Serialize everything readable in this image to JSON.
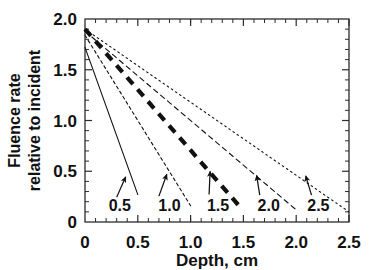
{
  "chart_data": {
    "type": "line",
    "title": "",
    "xlabel": "Depth, cm",
    "ylabel_line1": "Fluence rate",
    "ylabel_line2": "relative to incident",
    "xlim": [
      0,
      2.5
    ],
    "ylim": [
      0,
      2.0
    ],
    "xticks": [
      0,
      0.5,
      1.0,
      1.5,
      2.0,
      2.5
    ],
    "xticklabels": [
      "0",
      "0.5",
      "1.0",
      "1.5",
      "2.0",
      "2.5"
    ],
    "yticks": [
      0,
      0.5,
      1.0,
      1.5,
      2.0
    ],
    "yticklabels": [
      "0",
      "0.5",
      "1.0",
      "1.5",
      "2.0"
    ],
    "minor_ticks": true,
    "grid": false,
    "legend_position": "inline-callouts",
    "frame": "box",
    "series": [
      {
        "name": "0.5",
        "style": "solid",
        "width": 1.1,
        "x": [
          0.0,
          0.5
        ],
        "y": [
          1.72,
          0.27
        ]
      },
      {
        "name": "1.0",
        "style": "dashed-fine",
        "width": 1.1,
        "x": [
          0.0,
          1.0
        ],
        "y": [
          1.84,
          0.16
        ]
      },
      {
        "name": "1.5",
        "style": "dashed-thick",
        "width": 4.2,
        "x": [
          0.0,
          1.45
        ],
        "y": [
          1.9,
          0.17
        ]
      },
      {
        "name": "2.0",
        "style": "dashed-medium",
        "width": 1.1,
        "x": [
          0.0,
          2.0
        ],
        "y": [
          1.88,
          0.12
        ]
      },
      {
        "name": "2.5",
        "style": "dotted",
        "width": 1.1,
        "x": [
          0.0,
          2.5
        ],
        "y": [
          1.9,
          0.1
        ]
      }
    ],
    "annotations": [
      {
        "label": "0.5",
        "label_x": 0.33,
        "label_y": 0.165,
        "arrow_from_x": 0.3,
        "arrow_from_y": 0.245,
        "arrow_to_x": 0.385,
        "arrow_to_y": 0.445
      },
      {
        "label": "1.0",
        "label_x": 0.8,
        "label_y": 0.165,
        "arrow_from_x": 0.7,
        "arrow_from_y": 0.255,
        "arrow_to_x": 0.775,
        "arrow_to_y": 0.47
      },
      {
        "label": "1.5",
        "label_x": 1.26,
        "label_y": 0.165,
        "arrow_from_x": 1.175,
        "arrow_from_y": 0.27,
        "arrow_to_x": 1.185,
        "arrow_to_y": 0.5
      },
      {
        "label": "2.0",
        "label_x": 1.74,
        "label_y": 0.165,
        "arrow_from_x": 1.655,
        "arrow_from_y": 0.265,
        "arrow_to_x": 1.625,
        "arrow_to_y": 0.46
      },
      {
        "label": "2.5",
        "label_x": 2.21,
        "label_y": 0.165,
        "arrow_from_x": 2.145,
        "arrow_from_y": 0.265,
        "arrow_to_x": 2.09,
        "arrow_to_y": 0.455
      }
    ]
  }
}
